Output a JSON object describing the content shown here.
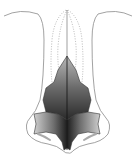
{
  "figure": {
    "colors": {
      "outline": "#8a8a8a",
      "dotted": "#9a9a9a",
      "cartilage_dark": "#2a2a2a",
      "cartilage_mid": "#6a6a6a",
      "cartilage_light": "#d0d0d0",
      "background": "#ffffff"
    },
    "labels": []
  }
}
